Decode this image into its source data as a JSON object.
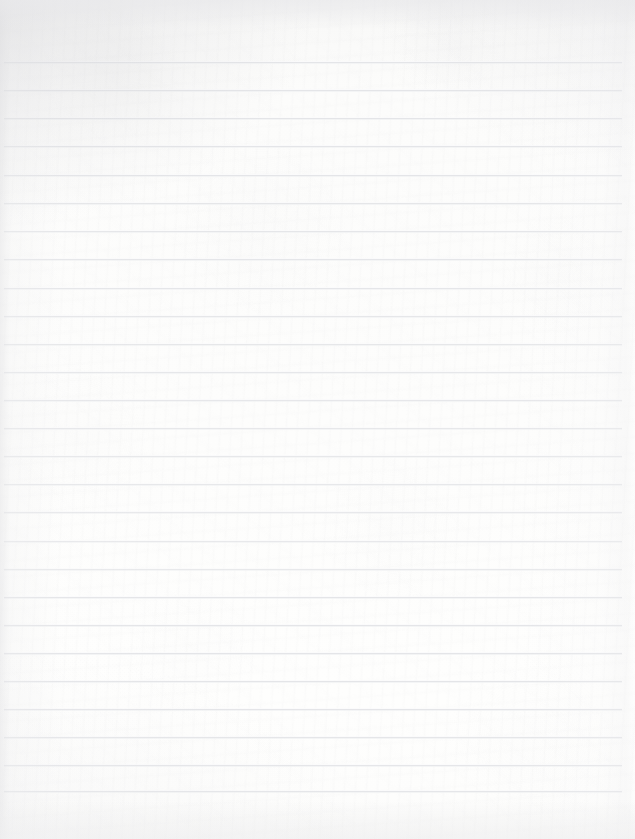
{
  "document": {
    "kind": "scanned-lined-paper",
    "title": "",
    "body_text": "",
    "notes": "",
    "page_width": 635,
    "page_height": 839
  },
  "colors": {
    "paper": "#fcfcfb",
    "paper_edge": "#f2f2f3",
    "rule_line": "#e4e5e8",
    "rule_halo": "#f0f1f3",
    "vignette": "#e4e4e6"
  },
  "ruling": {
    "line_count": 26,
    "first_line_y": 62,
    "line_spacing": 28.1,
    "line_thickness": 1,
    "line_start_x": 4,
    "line_end_x": 622,
    "header_margin_height": 62,
    "footer_margin_height": 46,
    "left_margin_width": 4,
    "right_margin_width": 13,
    "lines": [
      {
        "index": 1,
        "y": 62,
        "x1": 4,
        "x2": 622
      },
      {
        "index": 2,
        "y": 90,
        "x1": 4,
        "x2": 622
      },
      {
        "index": 3,
        "y": 118,
        "x1": 4,
        "x2": 622
      },
      {
        "index": 4,
        "y": 146,
        "x1": 4,
        "x2": 622
      },
      {
        "index": 5,
        "y": 175,
        "x1": 4,
        "x2": 622
      },
      {
        "index": 6,
        "y": 203,
        "x1": 4,
        "x2": 622
      },
      {
        "index": 7,
        "y": 231,
        "x1": 4,
        "x2": 622
      },
      {
        "index": 8,
        "y": 259,
        "x1": 4,
        "x2": 622
      },
      {
        "index": 9,
        "y": 288,
        "x1": 4,
        "x2": 622
      },
      {
        "index": 10,
        "y": 316,
        "x1": 4,
        "x2": 622
      },
      {
        "index": 11,
        "y": 344,
        "x1": 4,
        "x2": 622
      },
      {
        "index": 12,
        "y": 372,
        "x1": 4,
        "x2": 622
      },
      {
        "index": 13,
        "y": 400,
        "x1": 4,
        "x2": 622
      },
      {
        "index": 14,
        "y": 428,
        "x1": 4,
        "x2": 622
      },
      {
        "index": 15,
        "y": 456,
        "x1": 4,
        "x2": 622
      },
      {
        "index": 16,
        "y": 484,
        "x1": 4,
        "x2": 622
      },
      {
        "index": 17,
        "y": 512,
        "x1": 4,
        "x2": 622
      },
      {
        "index": 18,
        "y": 541,
        "x1": 4,
        "x2": 622
      },
      {
        "index": 19,
        "y": 569,
        "x1": 4,
        "x2": 622
      },
      {
        "index": 20,
        "y": 597,
        "x1": 4,
        "x2": 622
      },
      {
        "index": 21,
        "y": 625,
        "x1": 4,
        "x2": 622
      },
      {
        "index": 22,
        "y": 653,
        "x1": 4,
        "x2": 622
      },
      {
        "index": 23,
        "y": 681,
        "x1": 4,
        "x2": 622
      },
      {
        "index": 24,
        "y": 709,
        "x1": 4,
        "x2": 622
      },
      {
        "index": 25,
        "y": 737,
        "x1": 4,
        "x2": 622
      },
      {
        "index": 26,
        "y": 765,
        "x1": 4,
        "x2": 622
      },
      {
        "index": 27,
        "y": 791,
        "x1": 4,
        "x2": 622
      }
    ]
  }
}
